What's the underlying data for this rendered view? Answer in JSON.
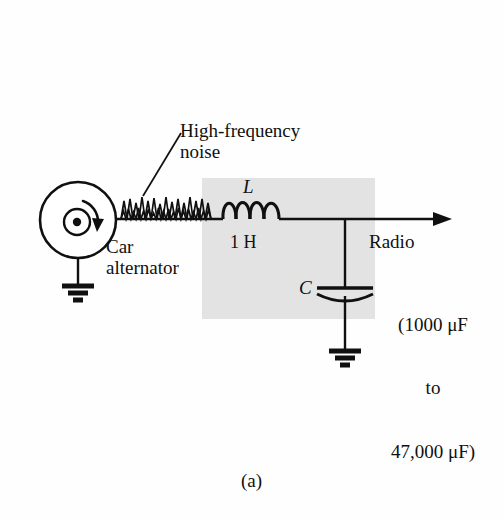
{
  "figure": {
    "caption": "(a)",
    "background_color": "#fefefe",
    "shaded_box_color": "#e2e2e2",
    "stroke_color": "#101010"
  },
  "labels": {
    "noise": "High-frequency\nnoise",
    "source": "Car\nalternator",
    "inductor_symbol": "L",
    "inductor_value": "1 H",
    "capacitor_symbol": "C",
    "output": "Radio",
    "capacitor_range": {
      "line1": "(1000 μF",
      "line2": "to",
      "line3": "47,000 μF)"
    }
  },
  "components": {
    "alternator": "ac-generator",
    "noise_waveform": "high-frequency-noise-squiggle",
    "inductor": "inductor-coil",
    "capacitor": "polarized-capacitor",
    "ground_source": "ground-symbol",
    "ground_capacitor": "ground-symbol",
    "output_arrow": "arrow-right"
  }
}
